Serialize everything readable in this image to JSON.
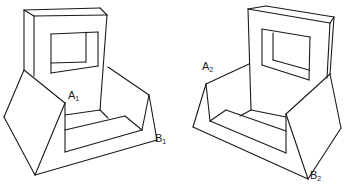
{
  "figure": {
    "views": [
      {
        "id": "view-1",
        "labels": [
          {
            "base": "A",
            "sub": "1",
            "x": 68,
            "y": 100
          },
          {
            "base": "B",
            "sub": "1",
            "x": 155,
            "y": 143
          }
        ],
        "edges": [
          [
            [
              24,
              10
            ],
            [
              100,
              8
            ]
          ],
          [
            [
              24,
              10
            ],
            [
              34,
              16
            ]
          ],
          [
            [
              34,
              16
            ],
            [
              107,
              15
            ]
          ],
          [
            [
              100,
              8
            ],
            [
              107,
              15
            ]
          ],
          [
            [
              24,
              10
            ],
            [
              24,
              70
            ]
          ],
          [
            [
              34,
              16
            ],
            [
              34,
              76
            ]
          ],
          [
            [
              107,
              15
            ],
            [
              100,
              110
            ]
          ],
          [
            [
              51,
              34
            ],
            [
              98,
              32
            ]
          ],
          [
            [
              51,
              34
            ],
            [
              51,
              73
            ]
          ],
          [
            [
              98,
              32
            ],
            [
              98,
              66
            ]
          ],
          [
            [
              51,
              73
            ],
            [
              98,
              66
            ]
          ],
          [
            [
              86,
              32
            ],
            [
              86,
              62
            ]
          ],
          [
            [
              51,
              63
            ],
            [
              86,
              62
            ]
          ],
          [
            [
              24,
              70
            ],
            [
              4,
              117
            ]
          ],
          [
            [
              24,
              70
            ],
            [
              65,
              103
            ]
          ],
          [
            [
              4,
              117
            ],
            [
              35,
              175
            ]
          ],
          [
            [
              65,
              103
            ],
            [
              35,
              175
            ]
          ],
          [
            [
              35,
              175
            ],
            [
              157,
              140
            ]
          ],
          [
            [
              157,
              140
            ],
            [
              149,
              95
            ]
          ],
          [
            [
              149,
              95
            ],
            [
              108,
              67
            ]
          ],
          [
            [
              149,
              95
            ],
            [
              142,
              130
            ]
          ],
          [
            [
              65,
              103
            ],
            [
              65,
              152
            ]
          ],
          [
            [
              65,
              152
            ],
            [
              142,
              130
            ]
          ],
          [
            [
              65,
              115
            ],
            [
              100,
              110
            ]
          ],
          [
            [
              100,
              110
            ],
            [
              108,
              118
            ]
          ],
          [
            [
              65,
              130
            ],
            [
              125,
              116
            ]
          ],
          [
            [
              125,
              116
            ],
            [
              142,
              130
            ]
          ]
        ]
      },
      {
        "id": "view-2",
        "labels": [
          {
            "base": "A",
            "sub": "2",
            "x": 202,
            "y": 71
          },
          {
            "base": "B",
            "sub": "2",
            "x": 310,
            "y": 180
          }
        ],
        "edges": [
          [
            [
              248,
              9
            ],
            [
              266,
              6
            ]
          ],
          [
            [
              266,
              6
            ],
            [
              334,
              17
            ]
          ],
          [
            [
              248,
              9
            ],
            [
              330,
              23
            ]
          ],
          [
            [
              330,
              23
            ],
            [
              334,
              17
            ]
          ],
          [
            [
              248,
              9
            ],
            [
              251,
              110
            ]
          ],
          [
            [
              330,
              23
            ],
            [
              327,
              78
            ]
          ],
          [
            [
              334,
              17
            ],
            [
              330,
              74
            ]
          ],
          [
            [
              262,
              29
            ],
            [
              310,
              37
            ]
          ],
          [
            [
              262,
              29
            ],
            [
              262,
              65
            ]
          ],
          [
            [
              310,
              37
            ],
            [
              309,
              80
            ]
          ],
          [
            [
              262,
              65
            ],
            [
              309,
              80
            ]
          ],
          [
            [
              273,
              33
            ],
            [
              273,
              60
            ]
          ],
          [
            [
              273,
              60
            ],
            [
              309,
              70
            ]
          ],
          [
            [
              206,
              84
            ],
            [
              249,
              64
            ]
          ],
          [
            [
              206,
              84
            ],
            [
              193,
              127
            ]
          ],
          [
            [
              206,
              84
            ],
            [
              210,
              121
            ]
          ],
          [
            [
              193,
              127
            ],
            [
              308,
              179
            ]
          ],
          [
            [
              308,
              179
            ],
            [
              286,
              114
            ]
          ],
          [
            [
              308,
              179
            ],
            [
              341,
              128
            ]
          ],
          [
            [
              341,
              128
            ],
            [
              330,
              74
            ]
          ],
          [
            [
              330,
              74
            ],
            [
              286,
              114
            ]
          ],
          [
            [
              210,
              121
            ],
            [
              226,
              110
            ]
          ],
          [
            [
              226,
              110
            ],
            [
              286,
              131
            ]
          ],
          [
            [
              210,
              121
            ],
            [
              286,
              153
            ]
          ],
          [
            [
              286,
              153
            ],
            [
              286,
              114
            ]
          ],
          [
            [
              240,
              116
            ],
            [
              251,
              110
            ]
          ],
          [
            [
              251,
              110
            ],
            [
              286,
              117
            ]
          ]
        ]
      }
    ],
    "colors": {
      "line": "#1a1a1a",
      "background": "#ffffff"
    }
  }
}
